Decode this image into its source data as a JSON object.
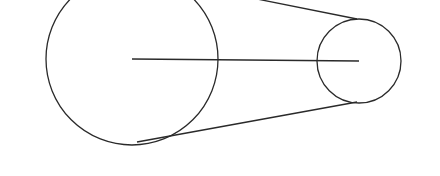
{
  "diagram": {
    "title": "",
    "type": "belt-pulley",
    "canvas": {
      "width": 440,
      "height": 176,
      "background": "#ffffff"
    },
    "stroke_color": "#2a2a2a",
    "pulleys": [
      {
        "id": "large-pulley",
        "cx": 132,
        "cy": 59,
        "r": 86
      },
      {
        "id": "small-pulley",
        "cx": 359,
        "cy": 61,
        "r": 42
      }
    ],
    "center_line": {
      "x1": 132,
      "y1": 59,
      "x2": 359,
      "y2": 61
    },
    "belt": {
      "upper": {
        "x1": 257,
        "y1": -1,
        "x2": 357,
        "y2": 19
      },
      "lower": {
        "x1": 137,
        "y1": 142,
        "x2": 357,
        "y2": 102
      }
    }
  }
}
